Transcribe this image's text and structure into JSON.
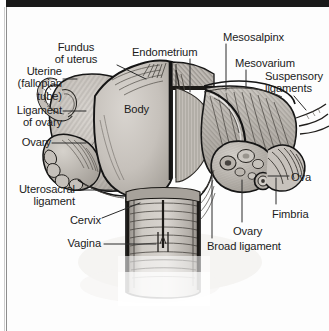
{
  "figure": {
    "kind": "anatomical-illustration",
    "width": 329,
    "height": 331,
    "background_color": "#ffffff",
    "frame": {
      "top_bar_color": "#1a1a1a",
      "left_rule_color": "#8d8d8d"
    },
    "palette": {
      "ink": "#1b1b1b",
      "outline": "#141414",
      "organ_light": "#cfcbc6",
      "organ_mid": "#b3aea8",
      "organ_dark": "#8e8982",
      "hatch": "#5d5953",
      "paper": "#fdfdfd"
    }
  },
  "labels": [
    {
      "id": "fundus-of-uterus",
      "text": "Fundus\nof uterus",
      "align": "center",
      "x": 66,
      "y": 41
    },
    {
      "id": "endometrium",
      "text": "Endometrium",
      "align": "left",
      "x": 132,
      "y": 46
    },
    {
      "id": "mesosalpinx",
      "text": "Mesosalpinx",
      "align": "left",
      "x": 223,
      "y": 31
    },
    {
      "id": "mesovarium",
      "text": "Mesovarium",
      "align": "left",
      "x": 235,
      "y": 57
    },
    {
      "id": "suspensory-ligaments",
      "text": "Suspensory\nligaments",
      "align": "left",
      "x": 265,
      "y": 70
    },
    {
      "id": "uterine-fallopian-tube",
      "text": "Uterine\n(fallopian\ntube)",
      "align": "right",
      "x": 12,
      "y": 65
    },
    {
      "id": "ligament-of-ovary",
      "text": "Ligament\nof ovary",
      "align": "right",
      "x": 12,
      "y": 104
    },
    {
      "id": "body",
      "text": "Body",
      "align": "left",
      "x": 124,
      "y": 103
    },
    {
      "id": "ovary-left",
      "text": "Ovary",
      "align": "right",
      "x": 12,
      "y": 136
    },
    {
      "id": "ova",
      "text": "Ova",
      "align": "left",
      "x": 291,
      "y": 171
    },
    {
      "id": "uterosacral-ligament",
      "text": "Uterosacral\nligament",
      "align": "right",
      "x": 12,
      "y": 183
    },
    {
      "id": "fimbria",
      "text": "Fimbria",
      "align": "left",
      "x": 272,
      "y": 208
    },
    {
      "id": "cervix",
      "text": "Cervix",
      "align": "right",
      "x": 62,
      "y": 214
    },
    {
      "id": "ovary-right",
      "text": "Ovary",
      "align": "left",
      "x": 233,
      "y": 225
    },
    {
      "id": "vagina",
      "text": "Vagina",
      "align": "right",
      "x": 62,
      "y": 237
    },
    {
      "id": "broad-ligament",
      "text": "Broad ligament",
      "align": "left",
      "x": 207,
      "y": 240
    }
  ],
  "structures": [
    "fundus of uterus",
    "body of uterus",
    "endometrium",
    "cervix",
    "vagina",
    "uterine (fallopian) tube",
    "ligament of ovary",
    "ovary",
    "ova",
    "fimbria",
    "mesosalpinx",
    "mesovarium",
    "broad ligament",
    "suspensory ligaments",
    "uterosacral ligament"
  ]
}
